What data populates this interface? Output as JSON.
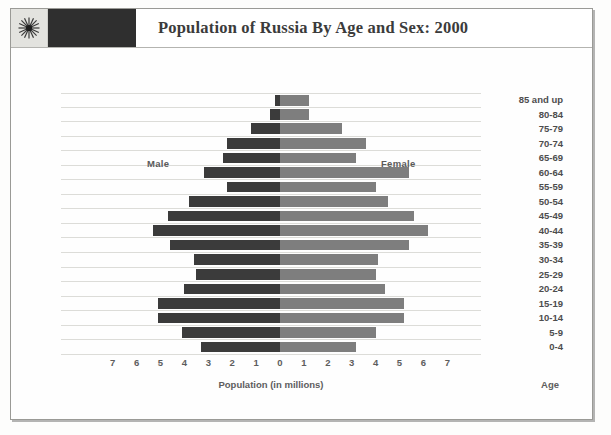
{
  "header": {
    "title": "Population of Russia By Age and Sex: 2000",
    "logo_icon": "starburst-icon"
  },
  "labels": {
    "male": "Male",
    "female": "Female",
    "x_caption": "Population (in millions)",
    "age_caption": "Age"
  },
  "colors": {
    "male_bar": "#3b3b3b",
    "female_bar": "#7e7e7e",
    "header_block": "#2f2f2f",
    "grid_line": "#dcdcd8",
    "text": "#4d4d4d"
  },
  "chart_data": {
    "type": "bar",
    "subtype": "population-pyramid",
    "title": "Population of Russia By Age and Sex: 2000",
    "xlabel": "Population (in millions)",
    "ylabel": "Age",
    "xlim": [
      -7.5,
      7.5
    ],
    "xticks": [
      7,
      6,
      5,
      4,
      3,
      2,
      1,
      0,
      1,
      2,
      3,
      4,
      5,
      6,
      7
    ],
    "grid": true,
    "legend_position": "in-plot",
    "categories": [
      "85 and up",
      "80-84",
      "75-79",
      "70-74",
      "65-69",
      "60-64",
      "55-59",
      "50-54",
      "45-49",
      "40-44",
      "35-39",
      "30-34",
      "25-29",
      "20-24",
      "15-19",
      "10-14",
      "5-9",
      "0-4"
    ],
    "series": [
      {
        "name": "Male",
        "side": "left",
        "color": "#3b3b3b",
        "values": [
          0.2,
          0.4,
          1.2,
          2.2,
          2.4,
          3.2,
          2.2,
          3.8,
          4.7,
          5.3,
          4.6,
          3.6,
          3.5,
          4.0,
          5.1,
          5.1,
          4.1,
          3.3
        ]
      },
      {
        "name": "Female",
        "side": "right",
        "color": "#7e7e7e",
        "values": [
          1.2,
          1.2,
          2.6,
          3.6,
          3.2,
          5.4,
          4.0,
          4.5,
          5.6,
          6.2,
          5.4,
          4.1,
          4.0,
          4.4,
          5.2,
          5.2,
          4.0,
          3.2
        ]
      }
    ]
  }
}
